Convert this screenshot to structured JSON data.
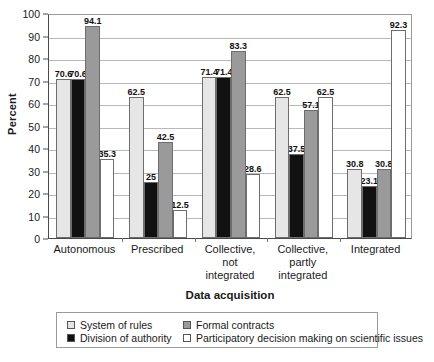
{
  "chart_data": {
    "type": "bar",
    "title": "",
    "xlabel": "Data acquisition",
    "ylabel": "Percent",
    "ylim": [
      0,
      100
    ],
    "ytick_step": 10,
    "yticks": [
      0,
      10,
      20,
      30,
      40,
      50,
      60,
      70,
      80,
      90,
      100
    ],
    "grid": true,
    "legend_position": "bottom",
    "categories": [
      "Autonomous",
      "Prescribed",
      "Collective,\nnot\nintegrated",
      "Collective,\npartly\nintegrated",
      "Integrated"
    ],
    "series": [
      {
        "name": "System of rules",
        "color": "#e6e6e6",
        "values": [
          70.6,
          62.5,
          71.4,
          62.5,
          30.8
        ]
      },
      {
        "name": "Division of authority",
        "color": "#111111",
        "values": [
          70.6,
          25,
          71.4,
          37.5,
          23.1
        ]
      },
      {
        "name": "Formal contracts",
        "color": "#9a9a9a",
        "values": [
          94.1,
          42.5,
          83.3,
          57.1,
          30.8
        ]
      },
      {
        "name": "Participatory decision making on scientific issues",
        "color": "#ffffff",
        "values": [
          35.3,
          12.5,
          28.6,
          62.5,
          92.3
        ]
      }
    ]
  }
}
